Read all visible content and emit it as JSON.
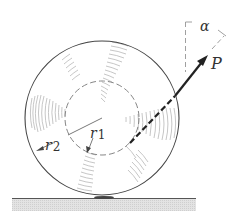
{
  "diagram": {
    "type": "mechanics-free-body",
    "labels": {
      "force": "P",
      "angle": "α",
      "inner_radius": "r",
      "inner_radius_sub": "1",
      "outer_radius": "r",
      "outer_radius_sub": "2"
    },
    "colors": {
      "line": "#333333",
      "hatch": "#b5b5b5",
      "ground_fill": "#d9d9d9",
      "dashed": "#888888"
    }
  }
}
